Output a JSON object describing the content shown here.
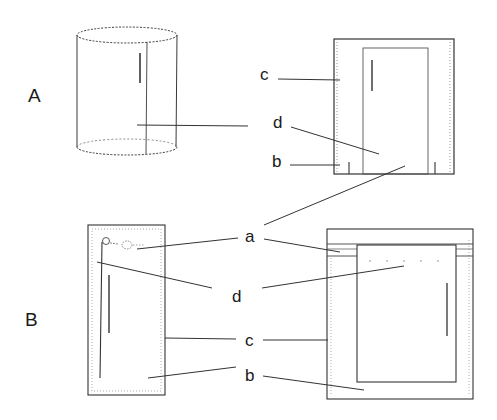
{
  "figure": {
    "width": 497,
    "height": 420,
    "colors": {
      "line": "#333333",
      "dotted": "#9a9a9a",
      "text": "#1a1a1a",
      "background": "#ffffff"
    }
  },
  "panels": [
    {
      "id": "A",
      "label": "A",
      "x": 28,
      "y": 102
    },
    {
      "id": "B",
      "label": "B",
      "x": 25,
      "y": 326
    }
  ],
  "labels": [
    {
      "id": "c-A",
      "text": "c",
      "x": 20,
      "y": 75
    },
    {
      "id": "d-A",
      "text": "d",
      "x": 33,
      "y": 128
    },
    {
      "id": "b-A",
      "text": "b",
      "x": 32,
      "y": 166
    },
    {
      "id": "a-center",
      "text": "a",
      "x": 245,
      "y": 242
    },
    {
      "id": "d-B",
      "text": "d",
      "x": 232,
      "y": 302
    },
    {
      "id": "c-B",
      "text": "c",
      "x": 245,
      "y": 347
    },
    {
      "id": "b-B",
      "text": "b",
      "x": 245,
      "y": 382
    }
  ],
  "leader_lines": [
    {
      "id": "A-cylinder-d",
      "x1": 137,
      "y1": 125,
      "x2": 248,
      "y2": 126
    },
    {
      "id": "A-c",
      "x1": 278,
      "y1": 79,
      "x2": 340,
      "y2": 80
    },
    {
      "id": "A-d",
      "x1": 291,
      "y1": 127,
      "x2": 379,
      "y2": 154
    },
    {
      "id": "A-b",
      "x1": 290,
      "y1": 165,
      "x2": 340,
      "y2": 165
    },
    {
      "id": "a-up",
      "x1": 264,
      "y1": 225,
      "x2": 405,
      "y2": 166
    },
    {
      "id": "a-left",
      "x1": 137,
      "y1": 248,
      "x2": 238,
      "y2": 238
    },
    {
      "id": "a-right",
      "x1": 264,
      "y1": 238,
      "x2": 340,
      "y2": 252
    },
    {
      "id": "d-left",
      "x1": 97,
      "y1": 262,
      "x2": 212,
      "y2": 288
    },
    {
      "id": "d-right",
      "x1": 262,
      "y1": 288,
      "x2": 404,
      "y2": 266
    },
    {
      "id": "c-left",
      "x1": 165,
      "y1": 338,
      "x2": 236,
      "y2": 339
    },
    {
      "id": "c-right",
      "x1": 262,
      "y1": 340,
      "x2": 328,
      "y2": 340
    },
    {
      "id": "b-left",
      "x1": 148,
      "y1": 378,
      "x2": 236,
      "y2": 367
    },
    {
      "id": "b-right",
      "x1": 262,
      "y1": 376,
      "x2": 364,
      "y2": 390
    }
  ],
  "shapes": {
    "cylinder": {
      "cx": 127,
      "top_y": 34,
      "bottom_y": 147,
      "rx": 50,
      "ry": 8,
      "center_line_x": 147
    },
    "A_box": {
      "x": 333,
      "y": 39,
      "w": 121,
      "h": 135,
      "inner": {
        "x": 363,
        "y": 48,
        "w": 65,
        "h": 126
      }
    },
    "B_narrow": {
      "x": 88,
      "y": 225,
      "w": 77,
      "h": 170
    },
    "B_wide": {
      "x": 327,
      "y": 229,
      "w": 146,
      "h": 171,
      "inner": {
        "x": 356,
        "y": 245,
        "w": 99,
        "h": 137
      }
    }
  }
}
